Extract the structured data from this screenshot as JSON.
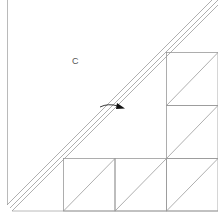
{
  "diagram": {
    "type": "quilt-block-construction",
    "label": "C",
    "colors": {
      "line": "#9a9a9a",
      "frame": "#a8a8a8",
      "arrow": "#111111",
      "background": "#ffffff"
    },
    "grid": {
      "cell_size": 51.5,
      "columns_x": [
        63,
        115,
        166,
        218
      ],
      "rows_y": [
        52,
        105,
        158,
        211
      ]
    },
    "squares": [
      {
        "id": "bottom-1",
        "x": 63,
        "y": 158
      },
      {
        "id": "bottom-2",
        "x": 115,
        "y": 158
      },
      {
        "id": "bottom-3",
        "x": 166,
        "y": 158
      },
      {
        "id": "right-middle",
        "x": 166,
        "y": 105
      },
      {
        "id": "right-top",
        "x": 166,
        "y": 52
      }
    ],
    "arrow": {
      "direction": "right",
      "description": "curved arrow pointing toward diagonal strip"
    }
  }
}
